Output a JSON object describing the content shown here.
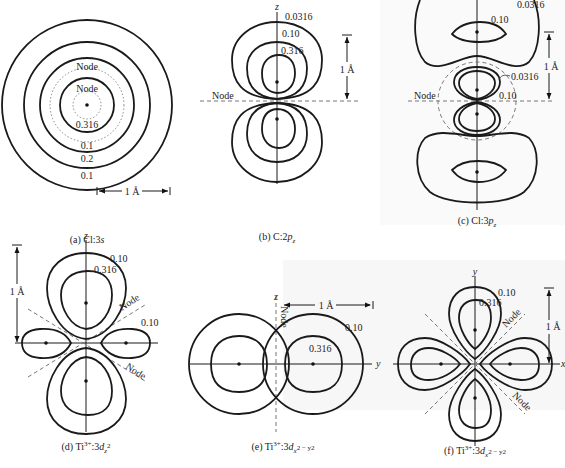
{
  "figure": {
    "panels": [
      {
        "id": "a",
        "caption_prefix": "(a) Cl:3",
        "caption_orbital": "s",
        "contour_labels": [
          "Node",
          "Node",
          "0.316",
          "0.1",
          "0.2",
          "0.1"
        ],
        "scale_label": "1 Å"
      },
      {
        "id": "b",
        "caption_prefix": "(b) C:2",
        "caption_orbital": "p",
        "caption_sub": "z",
        "axis_label": "z",
        "node_label": "Node",
        "contour_labels": [
          "0.0316",
          "0.10",
          "0.316"
        ],
        "scale_label": "1 Å"
      },
      {
        "id": "c",
        "caption_prefix": "(c) Cl:3",
        "caption_orbital": "p",
        "caption_sub": "z",
        "node_label": "Node",
        "contour_labels": [
          "0.0316",
          "0.10",
          "0.0316",
          "0.10"
        ],
        "scale_label": "1 Å"
      },
      {
        "id": "d",
        "caption_prefix": "(d) Ti",
        "caption_sup": "3+",
        "caption_mid": ":3",
        "caption_orbital": "d",
        "caption_sub": "z",
        "caption_sub_sup": "2",
        "axis_label": "z",
        "node_labels": [
          "Node",
          "Node"
        ],
        "contour_labels": [
          "0.10",
          "0.316",
          "0.10"
        ],
        "scale_label": "1 Å"
      },
      {
        "id": "e",
        "caption_prefix": "(e) Ti",
        "caption_sup": "3+",
        "caption_mid": ":3",
        "caption_orbital": "d",
        "caption_sub": "x",
        "caption_tail": "2 − y2",
        "axis_labels": [
          "z",
          "y"
        ],
        "node_label": "Node",
        "contour_labels": [
          "0.10",
          "0.316"
        ],
        "scale_label": "1 Å"
      },
      {
        "id": "f",
        "caption_prefix": "(f) Ti",
        "caption_sup": "3+",
        "caption_mid": ":3",
        "caption_orbital": "d",
        "caption_sub": "x",
        "caption_tail": "2 − y2",
        "axis_labels": [
          "y",
          "x"
        ],
        "node_labels": [
          "Node",
          "Node"
        ],
        "contour_labels": [
          "0.10",
          "0.316"
        ],
        "scale_label": "1 Å"
      }
    ],
    "colors": {
      "line": "#1a1a1a",
      "dashed": "#777777",
      "background": "#ffffff"
    }
  }
}
